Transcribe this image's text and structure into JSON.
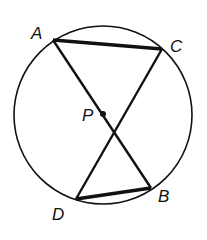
{
  "diagram": {
    "type": "circle-intersecting-chords",
    "circle": {
      "cx": 103,
      "cy": 115,
      "r": 89
    },
    "points": [
      {
        "id": "A",
        "label": "A",
        "x": 53,
        "y": 40,
        "label_x": 31,
        "label_y": 39
      },
      {
        "id": "C",
        "label": "C",
        "x": 162,
        "y": 49,
        "label_x": 170,
        "label_y": 52
      },
      {
        "id": "P",
        "label": "P",
        "x": 103,
        "y": 114,
        "label_x": 82,
        "label_y": 121
      },
      {
        "id": "B",
        "label": "B",
        "x": 151,
        "y": 188,
        "label_x": 158,
        "label_y": 202
      },
      {
        "id": "D",
        "label": "D",
        "x": 76,
        "y": 199,
        "label_x": 52,
        "label_y": 220
      }
    ],
    "segments": [
      {
        "from": "A",
        "to": "C",
        "weight": "thick"
      },
      {
        "from": "A",
        "to": "B",
        "weight": "normal"
      },
      {
        "from": "C",
        "to": "D",
        "weight": "normal"
      },
      {
        "from": "D",
        "to": "B",
        "weight": "thick"
      }
    ],
    "stroke_color": "#111111"
  }
}
